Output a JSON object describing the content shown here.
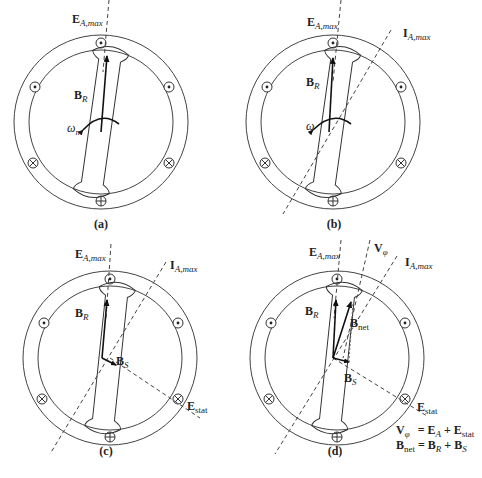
{
  "figure": {
    "panels": [
      {
        "id": "a",
        "caption": "(a)",
        "labels": {
          "ea_max": "E",
          "ea_max_sub": "A,max",
          "br": "B",
          "br_sub": "R",
          "omega": "ω",
          "omega_sub": "m"
        }
      },
      {
        "id": "b",
        "caption": "(b)",
        "labels": {
          "ea_max": "E",
          "ea_max_sub": "A,max",
          "ia_max": "I",
          "ia_max_sub": "A,max",
          "br": "B",
          "br_sub": "R",
          "omega": "ω"
        }
      },
      {
        "id": "c",
        "caption": "(c)",
        "labels": {
          "ea_max": "E",
          "ea_max_sub": "A,max",
          "ia_max": "I",
          "ia_max_sub": "A,max",
          "br": "B",
          "br_sub": "R",
          "bs": "B",
          "bs_sub": "S",
          "estat": "E",
          "estat_sub": "stat"
        }
      },
      {
        "id": "d",
        "caption": "(d)",
        "labels": {
          "ea_max": "E",
          "ea_max_sub": "A,max",
          "vphi": "V",
          "vphi_sub": "φ",
          "ia_max": "I",
          "ia_max_sub": "A,max",
          "br": "B",
          "br_sub": "R",
          "bnet": "B",
          "bnet_sub": "net",
          "bs": "B",
          "bs_sub": "S",
          "estat": "E",
          "estat_sub": "stat"
        }
      }
    ],
    "equations": [
      {
        "lhs": "V",
        "lhs_sub": "φ",
        "rhs": "= E",
        "rhs_sub1": "A",
        "mid": " + E",
        "rhs_sub2": "stat"
      },
      {
        "lhs": "B",
        "lhs_sub": "net",
        "rhs": " = B",
        "rhs_sub1": "R",
        "mid": " + B",
        "rhs_sub2": "S"
      }
    ],
    "conductor_symbols": {
      "dot": "⊙ out of page",
      "cross": "⊕ into page"
    }
  }
}
